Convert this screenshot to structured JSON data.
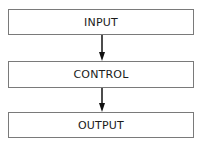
{
  "diagram": {
    "type": "flowchart",
    "direction": "top-to-bottom",
    "nodes": [
      {
        "id": "input",
        "label": "INPUT"
      },
      {
        "id": "control",
        "label": "CONTROL"
      },
      {
        "id": "output",
        "label": "OUTPUT"
      }
    ],
    "edges": [
      {
        "from": "input",
        "to": "control"
      },
      {
        "from": "control",
        "to": "output"
      }
    ],
    "colors": {
      "border": "#7a7a7a",
      "arrow": "#111111",
      "text": "#1a1a1a",
      "background": "#ffffff"
    }
  }
}
